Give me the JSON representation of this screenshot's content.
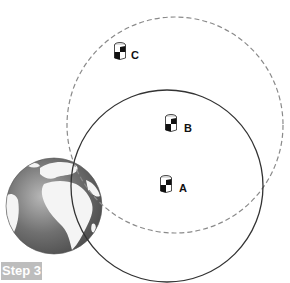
{
  "diagram": {
    "step_label": "Step 3",
    "colors": {
      "background": "#ffffff",
      "solid_circle": "#333333",
      "dashed_circle": "#8a8a8a",
      "globe_ocean": "#6e6e6e",
      "globe_land": "#ffffff",
      "step_badge_bg": "#bdbdbd",
      "step_badge_text": "#ffffff"
    },
    "circles": [
      {
        "name": "dashed-range-circle",
        "style": "dashed",
        "cx": 175,
        "cy": 125,
        "r": 108
      },
      {
        "name": "solid-range-circle",
        "style": "solid",
        "cx": 167,
        "cy": 186,
        "r": 96
      }
    ],
    "globe": {
      "cx": 54,
      "cy": 206,
      "r": 48
    },
    "stations": [
      {
        "id": "C",
        "label": "C",
        "x": 120,
        "y": 52
      },
      {
        "id": "B",
        "label": "B",
        "x": 171,
        "y": 124
      },
      {
        "id": "A",
        "label": "A",
        "x": 166,
        "y": 185
      }
    ]
  }
}
